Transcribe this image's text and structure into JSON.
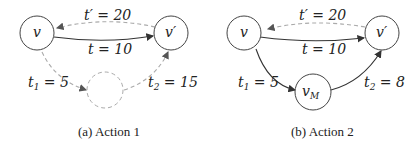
{
  "panels": [
    {
      "caption": "(a) Action 1",
      "nodes": {
        "v": "v",
        "v_prime": "v′",
        "mid": ""
      },
      "edges": {
        "t": "t = 10",
        "t_prime": "t′ = 20",
        "t1": "t",
        "t1_sub": "1",
        "t1_val": " = 5",
        "t2": "t",
        "t2_sub": "2",
        "t2_val": " = 15"
      }
    },
    {
      "caption": "(b) Action 2",
      "nodes": {
        "v": "v",
        "v_prime": "v′",
        "mid": "v",
        "mid_sub": "M"
      },
      "edges": {
        "t": "t = 10",
        "t_prime": "t′ = 20",
        "t1": "t",
        "t1_sub": "1",
        "t1_val": " = 5",
        "t2": "t",
        "t2_sub": "2",
        "t2_val": " = 8"
      }
    }
  ],
  "colors": {
    "solid_edge": "#333333",
    "dashed_edge": "#aaaaaa"
  }
}
